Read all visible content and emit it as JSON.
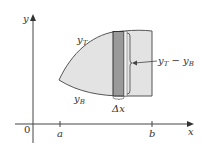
{
  "diagram": {
    "axes": {
      "x_label": "x",
      "y_label": "y",
      "origin_label": "0",
      "ticks": [
        {
          "label": "a"
        },
        {
          "label": "b"
        }
      ]
    },
    "curves": {
      "top_label_base": "y",
      "top_label_sub": "T",
      "bottom_label_base": "y",
      "bottom_label_sub": "B"
    },
    "strip": {
      "width_label": "Δx",
      "height_label_a": "y",
      "height_label_a_sub": "T",
      "height_label_minus": " − ",
      "height_label_b": "y",
      "height_label_b_sub": "B"
    },
    "colors": {
      "region_fill": "#e3e3e3",
      "strip_fill": "#9a9a9a",
      "outline": "#555555",
      "axis": "#444444"
    }
  }
}
